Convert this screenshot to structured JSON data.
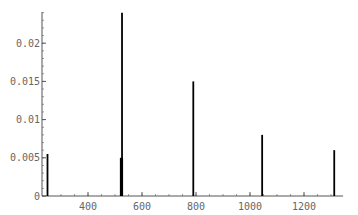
{
  "chart_data": {
    "type": "bar",
    "style": "stick spectrum",
    "title": "",
    "xlabel": "",
    "ylabel": "",
    "x": [
      250,
      524,
      526,
      790,
      1045,
      1312
    ],
    "values": [
      0.0055,
      0.005,
      0.024,
      0.015,
      0.008,
      0.006
    ],
    "xlim": [
      235,
      1330
    ],
    "ylim": [
      0,
      0.0242
    ],
    "x_ticks": [
      400,
      600,
      800,
      1000,
      1200
    ],
    "x_tick_labels": [
      "400",
      "600",
      "800",
      "1000",
      "1200"
    ],
    "y_ticks": [
      0,
      0.005,
      0.01,
      0.015,
      0.02
    ],
    "y_tick_labels": [
      "0",
      "0.005",
      "0.01",
      "0.015",
      "0.02"
    ],
    "grid": false,
    "legend": null,
    "colors": {
      "stick": "#000000",
      "axis": "#555555",
      "tick_label": "#666666"
    }
  }
}
